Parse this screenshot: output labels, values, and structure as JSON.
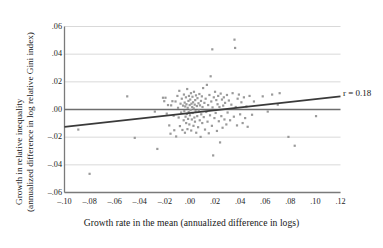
{
  "chart_data": {
    "type": "scatter",
    "title": "",
    "xlabel": "Growth rate in the mean (annualized difference in logs)",
    "ylabel_line1": "Growth in relative inequality",
    "ylabel_line2": "(annualized difference in log relative Gini index)",
    "xlim": [
      -0.1,
      0.12
    ],
    "ylim": [
      -0.06,
      0.06
    ],
    "xticks": [
      -0.1,
      -0.08,
      -0.06,
      -0.04,
      -0.02,
      0.0,
      0.02,
      0.04,
      0.06,
      0.08,
      0.1,
      0.12
    ],
    "xtick_labels": [
      "–.10",
      "–.08",
      "–.06",
      "–.04",
      "–.02",
      ".00",
      ".02",
      ".04",
      ".06",
      ".08",
      ".10",
      ".12"
    ],
    "yticks": [
      0.06,
      0.04,
      0.02,
      0.0,
      -0.02,
      -0.04,
      -0.06
    ],
    "ytick_labels": [
      ".06",
      ".04",
      ".02",
      ".00",
      "–.02",
      "–.04",
      "–.06"
    ],
    "grid": true,
    "grid_axis": "y",
    "legend": "none",
    "annotation": "r = 0.18",
    "correlation": 0.18,
    "zero_line_y": 0.0,
    "trendline": {
      "x": [
        -0.1,
        0.12
      ],
      "y": [
        -0.0125,
        0.0095
      ],
      "slope": 0.1,
      "intercept": -0.0025
    },
    "marker": {
      "shape": "square",
      "size": 2.2,
      "color": "#9a9a9a"
    },
    "colors": {
      "point": "#9a9a9a",
      "grid": "#d5d5d5",
      "axis": "#7a7a7a",
      "zero_line": "#6e6e6e",
      "trend_line": "#3a3a3a",
      "text": "#171717"
    },
    "n_points": 152,
    "points": [
      [
        -0.089,
        -0.0145
      ],
      [
        -0.08,
        -0.0465
      ],
      [
        -0.05,
        0.0095
      ],
      [
        -0.044,
        -0.0205
      ],
      [
        -0.028,
        -0.0015
      ],
      [
        -0.026,
        -0.0285
      ],
      [
        -0.0215,
        0.0085
      ],
      [
        -0.0205,
        0.006
      ],
      [
        -0.0195,
        0.0085
      ],
      [
        -0.0185,
        -0.003
      ],
      [
        -0.0175,
        0.0032
      ],
      [
        -0.0165,
        -0.0115
      ],
      [
        -0.0155,
        -0.0175
      ],
      [
        -0.015,
        0.003
      ],
      [
        -0.014,
        0.006
      ],
      [
        -0.013,
        -0.0045
      ],
      [
        -0.0125,
        -0.015
      ],
      [
        -0.0115,
        0.0058
      ],
      [
        -0.011,
        -0.0195
      ],
      [
        -0.01,
        0.0098
      ],
      [
        -0.0095,
        0.0012
      ],
      [
        -0.009,
        -0.0058
      ],
      [
        -0.0085,
        0.0135
      ],
      [
        -0.008,
        -0.012
      ],
      [
        -0.0075,
        0.0042
      ],
      [
        -0.007,
        -0.0022
      ],
      [
        -0.0065,
        0.0078
      ],
      [
        -0.006,
        -0.0148
      ],
      [
        -0.0055,
        0.0028
      ],
      [
        -0.005,
        -0.0078
      ],
      [
        -0.0048,
        0.0108
      ],
      [
        -0.0045,
        -0.0012
      ],
      [
        -0.0042,
        0.005
      ],
      [
        -0.004,
        -0.0168
      ],
      [
        -0.0038,
        0.0022
      ],
      [
        -0.0035,
        -0.0052
      ],
      [
        -0.0032,
        0.0088
      ],
      [
        -0.003,
        -0.0098
      ],
      [
        -0.0028,
        0.0038
      ],
      [
        -0.0025,
        -0.0032
      ],
      [
        -0.0022,
        0.0148
      ],
      [
        -0.002,
        -0.0142
      ],
      [
        -0.0018,
        0.0012
      ],
      [
        -0.0015,
        -0.0068
      ],
      [
        -0.0012,
        0.0062
      ],
      [
        -0.001,
        -0.0018
      ],
      [
        -0.0008,
        0.0098
      ],
      [
        -0.0005,
        -0.0108
      ],
      [
        -0.0002,
        0.0032
      ],
      [
        0.0,
        -0.0042
      ],
      [
        0.0002,
        0.0072
      ],
      [
        0.0005,
        -0.0005
      ],
      [
        0.0008,
        0.0118
      ],
      [
        0.001,
        -0.0152
      ],
      [
        0.0012,
        0.0042
      ],
      [
        0.0015,
        -0.0072
      ],
      [
        0.0018,
        0.0018
      ],
      [
        0.002,
        0.0092
      ],
      [
        0.0022,
        -0.0025
      ],
      [
        0.0025,
        0.0052
      ],
      [
        0.0028,
        -0.0118
      ],
      [
        0.003,
        0.0008
      ],
      [
        0.0032,
        0.0128
      ],
      [
        0.0035,
        -0.0058
      ],
      [
        0.0038,
        0.0035
      ],
      [
        0.004,
        -0.0088
      ],
      [
        0.0042,
        0.0068
      ],
      [
        0.0045,
        -0.0012
      ],
      [
        0.0048,
        0.0102
      ],
      [
        0.005,
        -0.0168
      ],
      [
        0.0055,
        0.0025
      ],
      [
        0.0058,
        -0.0048
      ],
      [
        0.006,
        0.0082
      ],
      [
        0.0065,
        -0.0128
      ],
      [
        0.0068,
        0.0045
      ],
      [
        0.007,
        -0.0008
      ],
      [
        0.0075,
        0.0112
      ],
      [
        0.0078,
        -0.0078
      ],
      [
        0.008,
        0.003
      ],
      [
        0.0085,
        -0.0198
      ],
      [
        0.0088,
        0.0062
      ],
      [
        0.009,
        -0.0035
      ],
      [
        0.0095,
        0.0095
      ],
      [
        0.0098,
        -0.0098
      ],
      [
        0.01,
        0.0018
      ],
      [
        0.0105,
        0.0155
      ],
      [
        0.011,
        -0.0055
      ],
      [
        0.0115,
        0.0048
      ],
      [
        0.012,
        -0.0145
      ],
      [
        0.0125,
        0.0078
      ],
      [
        0.013,
        -0.0018
      ],
      [
        0.0135,
        0.0178
      ],
      [
        0.014,
        -0.0088
      ],
      [
        0.0145,
        0.0032
      ],
      [
        0.015,
        -0.0172
      ],
      [
        0.0155,
        0.0105
      ],
      [
        0.016,
        -0.0042
      ],
      [
        0.0165,
        0.024
      ],
      [
        0.017,
        0.0058
      ],
      [
        0.0175,
        -0.0118
      ],
      [
        0.0178,
        0.0435
      ],
      [
        0.018,
        0.0015
      ],
      [
        0.0185,
        -0.0332
      ],
      [
        0.019,
        0.0088
      ],
      [
        0.0195,
        -0.0062
      ],
      [
        0.02,
        0.0128
      ],
      [
        0.0205,
        -0.0025
      ],
      [
        0.021,
        0.0068
      ],
      [
        0.0215,
        -0.0155
      ],
      [
        0.022,
        0.0038
      ],
      [
        0.0225,
        0.0098
      ],
      [
        0.023,
        -0.0085
      ],
      [
        0.0235,
        0.0018
      ],
      [
        0.024,
        -0.0238
      ],
      [
        0.0245,
        0.0115
      ],
      [
        0.025,
        -0.0048
      ],
      [
        0.0255,
        0.0072
      ],
      [
        0.026,
        -0.0132
      ],
      [
        0.0265,
        0.0028
      ],
      [
        0.027,
        0.0088
      ],
      [
        0.0275,
        -0.0072
      ],
      [
        0.028,
        0.0048
      ],
      [
        0.029,
        -0.0108
      ],
      [
        0.0295,
        0.0105
      ],
      [
        0.03,
        -0.0022
      ],
      [
        0.031,
        0.0065
      ],
      [
        0.032,
        -0.0078
      ],
      [
        0.033,
        0.0035
      ],
      [
        0.034,
        0.0118
      ],
      [
        0.035,
        -0.0052
      ],
      [
        0.0355,
        0.0505
      ],
      [
        0.036,
        0.0445
      ],
      [
        0.0365,
        0.0018
      ],
      [
        0.0375,
        -0.0115
      ],
      [
        0.038,
        0.0078
      ],
      [
        0.039,
        0.0108
      ],
      [
        0.04,
        -0.0035
      ],
      [
        0.041,
        0.0052
      ],
      [
        0.042,
        -0.0098
      ],
      [
        0.043,
        0.0088
      ],
      [
        0.044,
        -0.0062
      ],
      [
        0.045,
        0.0022
      ],
      [
        0.046,
        -0.0125
      ],
      [
        0.0475,
        0.0098
      ],
      [
        0.0495,
        -0.0038
      ],
      [
        0.051,
        0.0058
      ],
      [
        0.058,
        0.0095
      ],
      [
        0.062,
        -0.0015
      ],
      [
        0.0655,
        0.0108
      ],
      [
        0.07,
        0.0035
      ],
      [
        0.0715,
        0.0118
      ],
      [
        0.0785,
        -0.0198
      ],
      [
        0.0835,
        -0.0262
      ],
      [
        0.1005,
        -0.0048
      ]
    ]
  }
}
